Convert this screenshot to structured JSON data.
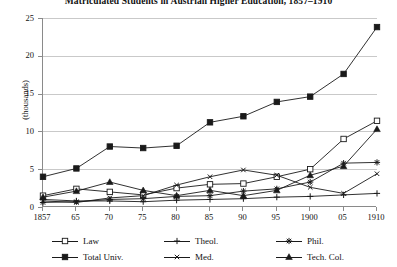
{
  "title": "Matriculated Students in Austrian Higher Education, 1857–1910",
  "axes": {
    "ylabel": "(thousands)",
    "yticks": [
      "0",
      "5",
      "10",
      "15",
      "20",
      "25"
    ],
    "xticks": [
      "1857",
      "65",
      "70",
      "75",
      "80",
      "85",
      "90",
      "95",
      "1900",
      "05",
      "1910"
    ]
  },
  "legend": [
    {
      "label": "Law",
      "marker": "open-square",
      "key": "law"
    },
    {
      "label": "Theol.",
      "marker": "plus",
      "key": "theol"
    },
    {
      "label": "Phil.",
      "marker": "asterisk",
      "key": "phil"
    },
    {
      "label": "Total Univ.",
      "marker": "filled-square",
      "key": "total"
    },
    {
      "label": "Med.",
      "marker": "cross",
      "key": "med"
    },
    {
      "label": "Tech. Col.",
      "marker": "filled-triangle",
      "key": "tech"
    }
  ],
  "chart_data": {
    "type": "line",
    "title": "Matriculated Students in Austrian Higher Education, 1857–1910",
    "xlabel": "",
    "ylabel": "(thousands)",
    "ylim": [
      0,
      25
    ],
    "grid": true,
    "legend_position": "bottom",
    "categories": [
      "1857",
      "65",
      "70",
      "75",
      "80",
      "85",
      "90",
      "95",
      "1900",
      "05",
      "1910"
    ],
    "x_years": [
      1857,
      1865,
      1870,
      1875,
      1880,
      1885,
      1890,
      1895,
      1900,
      1905,
      1910
    ],
    "series": [
      {
        "name": "Total Univ.",
        "marker": "filled-square",
        "values": [
          4.0,
          5.1,
          8.0,
          7.8,
          8.1,
          11.2,
          12.0,
          13.9,
          14.6,
          17.6,
          23.8
        ]
      },
      {
        "name": "Law",
        "marker": "open-square",
        "values": [
          1.5,
          2.4,
          2.0,
          1.6,
          2.5,
          3.0,
          3.1,
          4.0,
          5.0,
          9.0,
          11.4
        ]
      },
      {
        "name": "Tech. Col.",
        "marker": "filled-triangle",
        "values": [
          1.3,
          2.1,
          3.3,
          2.2,
          1.5,
          2.2,
          1.5,
          2.2,
          4.2,
          5.4,
          10.3
        ]
      },
      {
        "name": "Med.",
        "marker": "cross",
        "values": [
          0.8,
          0.6,
          1.2,
          1.5,
          2.9,
          4.0,
          4.9,
          4.2,
          2.6,
          1.8,
          4.4
        ]
      },
      {
        "name": "Phil.",
        "marker": "asterisk",
        "values": [
          0.6,
          0.7,
          1.0,
          1.1,
          1.4,
          1.5,
          2.1,
          2.4,
          3.3,
          5.8,
          5.9
        ]
      },
      {
        "name": "Theol.",
        "marker": "plus",
        "values": [
          1.0,
          0.8,
          0.8,
          0.7,
          0.9,
          1.0,
          1.1,
          1.3,
          1.4,
          1.6,
          1.8
        ]
      }
    ]
  },
  "colors": {
    "line": "#1a1a1a",
    "grid": "#c9c9c9",
    "axis": "#8a8a8a",
    "text": "#111111",
    "background": "#ffffff"
  }
}
